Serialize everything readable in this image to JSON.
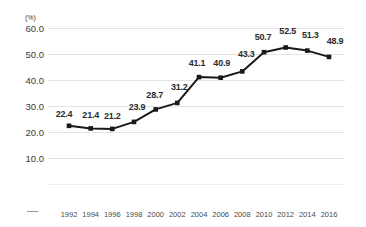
{
  "chart_data": {
    "type": "line",
    "title": "",
    "xlabel": "",
    "ylabel": "",
    "unit_label": "(%)",
    "categories": [
      "1992",
      "1994",
      "1996",
      "1998",
      "2000",
      "2002",
      "2004",
      "2006",
      "2008",
      "2010",
      "2012",
      "2014",
      "2016"
    ],
    "values": [
      22.4,
      21.4,
      21.2,
      23.9,
      28.7,
      31.2,
      41.1,
      40.9,
      43.3,
      50.7,
      52.5,
      51.3,
      48.9
    ],
    "point_labels": [
      "22.4",
      "21.4",
      "21.2",
      "23.9",
      "28.7",
      "31.2",
      "41.1",
      "40.9",
      "43.3",
      "50.7",
      "52.5",
      "51.3",
      "48.9"
    ],
    "yticks": [
      "60.0",
      "50.0",
      "40.0",
      "30.0",
      "20.0",
      "10.0"
    ],
    "ytick_values": [
      60.0,
      50.0,
      40.0,
      30.0,
      20.0,
      10.0
    ],
    "ylim": [
      0,
      60
    ],
    "grid": true,
    "legend": "none",
    "series": [
      {
        "name": "",
        "values": [
          22.4,
          21.4,
          21.2,
          23.9,
          28.7,
          31.2,
          41.1,
          40.9,
          43.3,
          50.7,
          52.5,
          51.3,
          48.9
        ]
      }
    ],
    "colors": {
      "line": "#1a1a1a",
      "marker": "#1a1a1a",
      "gridline": "#e3e3e3",
      "label_text": "#2b2b2b",
      "axis_text": "#3a3a3a",
      "background": "#ffffff"
    }
  }
}
